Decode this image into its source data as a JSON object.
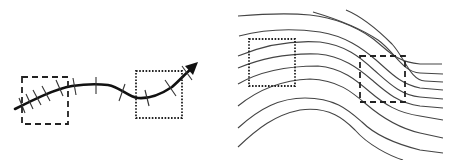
{
  "figure": {
    "left_panel": {
      "description": "Single curved path with transverse tick marks and an arrowhead",
      "elements": [
        "curved-arrow",
        "tick-marks",
        "dashed-box",
        "dotted-box"
      ]
    },
    "right_panel": {
      "description": "Family of parallel flowing streamlines bending downward",
      "elements": [
        "streamlines",
        "dotted-box",
        "dashed-box"
      ]
    },
    "colors": {
      "background": "#ffffff",
      "stroke": "#111111",
      "streamline": "#444444"
    }
  }
}
